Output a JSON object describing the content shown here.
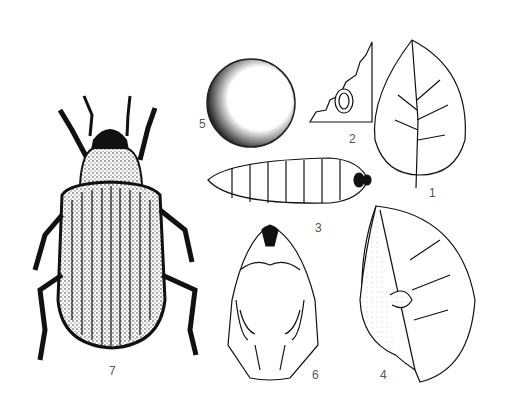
{
  "figure": {
    "labels": [
      {
        "id": "1",
        "text": "1",
        "subject": "leaf"
      },
      {
        "id": "2",
        "text": "2",
        "subject": "leaf-fragment-with-egg"
      },
      {
        "id": "3",
        "text": "3",
        "subject": "larva"
      },
      {
        "id": "4",
        "text": "4",
        "subject": "rolled-leaf"
      },
      {
        "id": "5",
        "text": "5",
        "subject": "egg"
      },
      {
        "id": "6",
        "text": "6",
        "subject": "pupa"
      },
      {
        "id": "7",
        "text": "7",
        "subject": "adult-beetle"
      }
    ],
    "colors": {
      "ink": "#111111",
      "label": "#555555",
      "background": "#ffffff"
    }
  }
}
